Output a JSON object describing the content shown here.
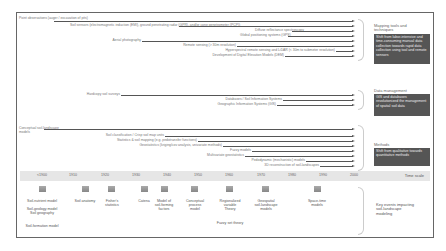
{
  "diagram": {
    "time_axis": {
      "label": "Time scale",
      "ticks": [
        "<1900",
        "1910",
        "1920",
        "1930",
        "1940",
        "1950",
        "1960",
        "1970",
        "1980",
        "1990",
        "2000"
      ]
    },
    "groups": [
      {
        "title": "Mapping tools and techniques",
        "summary": "Shift from labor-intensive and time-consuming manual data collection towards rapid data collection using tool and remote sensors",
        "items": [
          {
            "label": "Point observations (auger / excavation of pits)",
            "start": "<1900"
          },
          {
            "label": "Soil sensors (electromagnetic induction (EMI), ground penetrating radar (GPR), and/or cone penetrometer (PCP))",
            "start": "1990"
          },
          {
            "label": "Diffuse reflectance spectroscopy",
            "start": "1990"
          },
          {
            "label": "Global positioning systems (GPS)",
            "start": "1990"
          },
          {
            "label": "Aerial photography",
            "start": "1930"
          },
          {
            "label": "Remote sensing (> 30m resolution)",
            "start": "1970"
          },
          {
            "label": "Hyperspectral remote sensing and LiDAR (< 30m to submeter resolution)",
            "start": "1990"
          },
          {
            "label": "Development of Digital Elevation Models (DEM)",
            "start": "1980"
          }
        ]
      },
      {
        "title": "Data management",
        "summary": "GIS and databases revolutionized the management of spatial soil data",
        "items": [
          {
            "label": "Hardcopy soil surveys",
            "start": "1930"
          },
          {
            "label": "Databases / Soil Information Systems",
            "start": "1980"
          },
          {
            "label": "Geographic Information Systems (GIS)",
            "start": "1980"
          }
        ]
      },
      {
        "title": "Methods",
        "summary": "Shift from qualitative towards quantitative methods",
        "items": [
          {
            "label": "Conceptual soil-landscape models",
            "start": "<1900"
          },
          {
            "label": "Soil classification / Crisp soil map units",
            "start": "1940"
          },
          {
            "label": "Statistics & soil mapping (e.g. pedotransfer functions)",
            "start": "1940"
          },
          {
            "label": "Geostatistics (kriging/cov analysis, univariate methods)",
            "start": "1950"
          },
          {
            "label": "Fuzzy models",
            "start": "1970"
          },
          {
            "label": "Multivariate geostatistics",
            "start": "1970"
          },
          {
            "label": "Pedodynamic (mechanistic) models",
            "start": "1980"
          },
          {
            "label": "3D reconstruction of soil-landscapes",
            "start": "1990"
          }
        ]
      }
    ],
    "events": {
      "title": "Key events impacting soil-landscape modeling",
      "items": [
        {
          "label": "Soil-nutrient model",
          "year": "<1900"
        },
        {
          "label": "Soil-geology model\nSoil geography",
          "year": "<1900"
        },
        {
          "label": "Soil-formation model",
          "year": "<1900"
        },
        {
          "label": "Soil anatomy",
          "year": "1910"
        },
        {
          "label": "Fisher's\nstatistics",
          "year": "1920"
        },
        {
          "label": "Catena",
          "year": "1930"
        },
        {
          "label": "Model of\nsoil-forming\nfactors",
          "year": "1940"
        },
        {
          "label": "Conceptual\nprocess\nmodel",
          "year": "1950"
        },
        {
          "label": "Regionalized\nvariable\nTheory",
          "year": "1960"
        },
        {
          "label": "Fuzzy set theory",
          "year": "1960"
        },
        {
          "label": "Geospatial\nsoil-landscape\nmodels",
          "year": "1970"
        },
        {
          "label": "Space-time\nmodels",
          "year": "1990"
        }
      ]
    }
  }
}
